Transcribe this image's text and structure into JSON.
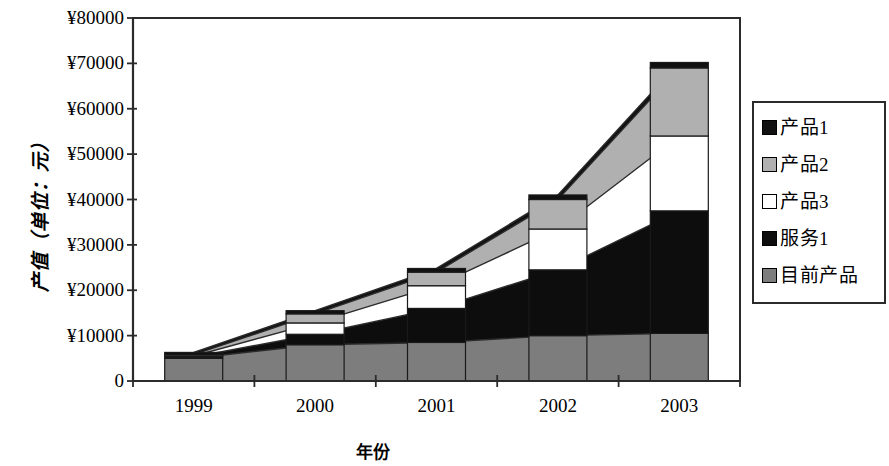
{
  "chart_data": {
    "type": "area",
    "title": "",
    "xlabel": "年份",
    "ylabel": "产值（单位：元）",
    "categories": [
      "1999",
      "2000",
      "2001",
      "2002",
      "2003"
    ],
    "ylim": [
      0,
      80000
    ],
    "ytick_labels": [
      "¥80000",
      "¥70000",
      "¥60000",
      "¥50000",
      "¥40000",
      "¥30000",
      "¥20000",
      "¥10000",
      "0"
    ],
    "ytick_values": [
      80000,
      70000,
      60000,
      50000,
      40000,
      30000,
      20000,
      10000,
      0
    ],
    "grid": false,
    "legend_position": "right",
    "stacked": true,
    "stack_order_bottom_to_top": [
      "目前产品",
      "服务1",
      "产品3",
      "产品2",
      "产品1"
    ],
    "series": [
      {
        "name": "产品1",
        "color": "#111111",
        "values": [
          500,
          700,
          800,
          1000,
          1200
        ]
      },
      {
        "name": "产品2",
        "color": "#b0b0b0",
        "values": [
          300,
          2000,
          3000,
          6500,
          15000
        ]
      },
      {
        "name": "产品3",
        "color": "#ffffff",
        "values": [
          200,
          2500,
          5000,
          9000,
          16500
        ]
      },
      {
        "name": "服务1",
        "color": "#0d0d0d",
        "values": [
          300,
          2300,
          7500,
          14500,
          27000
        ]
      },
      {
        "name": "目前产品",
        "color": "#7d7d7d",
        "values": [
          5000,
          8000,
          8500,
          10000,
          10500
        ]
      }
    ],
    "totals": [
      6300,
      15500,
      24800,
      41000,
      70200
    ]
  },
  "legend": {
    "items": [
      {
        "label": "产品1",
        "swatch": "#111111"
      },
      {
        "label": "产品2",
        "swatch": "#b0b0b0"
      },
      {
        "label": "产品3",
        "swatch": "#ffffff"
      },
      {
        "label": "服务1",
        "swatch": "#0d0d0d"
      },
      {
        "label": "目前产品",
        "swatch": "#7d7d7d"
      }
    ]
  }
}
